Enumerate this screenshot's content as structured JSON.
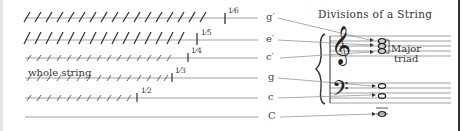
{
  "title": "Divisions of a String",
  "strings": [
    {
      "fraction": "1/6",
      "note": "g′",
      "ticks": 14
    },
    {
      "fraction": "1/5",
      "note": "e′",
      "ticks": 12
    },
    {
      "fraction": "1/4",
      "note": "c′",
      "ticks": 11
    },
    {
      "fraction": "1/3",
      "note": "g",
      "ticks": 14
    },
    {
      "fraction": "1/2",
      "note": "c",
      "ticks": 11
    },
    {
      "fraction": "",
      "note": "C",
      "ticks": 0
    }
  ],
  "whole_string_label": "whole string",
  "fractions": {
    "f6": "1⁄6",
    "f5": "1⁄5",
    "f4": "1⁄4",
    "f3": "1⁄3",
    "f2": "1⁄2"
  },
  "notes": {
    "n1": "g′",
    "n2": "e′",
    "n3": "c′",
    "n4": "g",
    "n5": "c",
    "n6": "C"
  },
  "triad": {
    "line1": "Major",
    "line2": "triad"
  },
  "clefs": {
    "treble": "𝄞",
    "bass": "𝄢"
  }
}
